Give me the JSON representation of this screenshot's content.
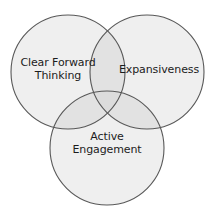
{
  "diagram": {
    "type": "venn-3-circle",
    "title": "",
    "background_color": "#ffffff",
    "circle_fill": "#efefef",
    "overlap_fill": "#e2e2e2",
    "triple_overlap_fill": "#dcdcdc",
    "stroke_color": "#585858",
    "stroke_width": 1.1,
    "text_color": "#1c1c1c",
    "circles": [
      {
        "id": "clear-forward-thinking",
        "label_lines": [
          "Clear Forward",
          "Thinking"
        ],
        "label": "Clear Forward Thinking",
        "cx": 68,
        "cy": 72,
        "r": 57
      },
      {
        "id": "expansiveness",
        "label_lines": [
          "Expansiveness"
        ],
        "label": "Expansiveness",
        "cx": 147,
        "cy": 72,
        "r": 57
      },
      {
        "id": "active-engagement",
        "label_lines": [
          "Active",
          "Engagement"
        ],
        "label": "Active Engagement",
        "cx": 107,
        "cy": 148,
        "r": 57
      }
    ]
  }
}
